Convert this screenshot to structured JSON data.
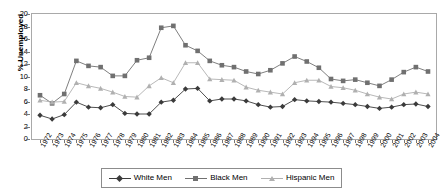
{
  "chart_data": {
    "type": "line",
    "title": "",
    "xlabel": "",
    "ylabel": "% Unemployed",
    "ylim": [
      0,
      20
    ],
    "ytick_step": 2,
    "yticks": [
      0,
      2,
      4,
      6,
      8,
      10,
      12,
      14,
      16,
      18,
      20
    ],
    "grid": false,
    "legend_position": "bottom",
    "x": [
      1972,
      1973,
      1974,
      1975,
      1976,
      1977,
      1978,
      1979,
      1980,
      1981,
      1982,
      1983,
      1984,
      1985,
      1986,
      1987,
      1988,
      1989,
      1990,
      1991,
      1992,
      1993,
      1994,
      1995,
      1996,
      1997,
      1998,
      1999,
      2000,
      2001,
      2002,
      2003,
      2004
    ],
    "categories": [
      "1972",
      "1973",
      "1974",
      "1975",
      "1976",
      "1977",
      "1978",
      "1979",
      "1980",
      "1981",
      "1982",
      "1983",
      "1984",
      "1985",
      "1986",
      "1987",
      "1988",
      "1989",
      "1990",
      "1991",
      "1992",
      "1993",
      "1994",
      "1995",
      "1996",
      "1997",
      "1998",
      "1999",
      "2000",
      "2001",
      "2002",
      "2003",
      "2004"
    ],
    "series": [
      {
        "name": "White Men",
        "color": "#3b3b3b",
        "marker": "diamond",
        "values": [
          3.8,
          3.2,
          3.9,
          5.9,
          5.1,
          5.0,
          5.5,
          4.1,
          4.0,
          4.0,
          5.9,
          6.2,
          8.0,
          8.1,
          6.1,
          6.4,
          6.4,
          6.1,
          5.5,
          5.1,
          5.2,
          6.3,
          6.1,
          6.0,
          5.9,
          5.7,
          5.5,
          5.2,
          4.9,
          5.1,
          5.5,
          5.6,
          5.2
        ]
      },
      {
        "name": "Black Men",
        "color": "#707070",
        "marker": "square",
        "values": [
          7.0,
          5.7,
          7.2,
          12.5,
          11.7,
          11.5,
          10.1,
          10.1,
          12.6,
          13.0,
          17.8,
          18.1,
          15.0,
          14.1,
          12.5,
          11.8,
          11.5,
          10.8,
          10.4,
          11.0,
          12.1,
          13.2,
          12.4,
          11.4,
          9.6,
          9.3,
          9.5,
          9.0,
          8.5,
          9.5,
          10.7,
          11.5,
          10.8
        ]
      },
      {
        "name": "Hispanic Men",
        "color": "#b0b0b0",
        "marker": "triangle",
        "values": [
          6.2,
          5.9,
          6.0,
          9.0,
          8.5,
          8.1,
          7.5,
          6.8,
          6.7,
          8.5,
          9.8,
          9.0,
          12.2,
          12.2,
          9.6,
          9.5,
          9.4,
          8.3,
          7.8,
          7.5,
          7.2,
          9.0,
          9.4,
          9.4,
          8.4,
          8.2,
          7.8,
          7.2,
          6.7,
          6.4,
          7.2,
          7.5,
          7.2
        ]
      }
    ]
  },
  "legend": {
    "items": [
      {
        "label": "White Men"
      },
      {
        "label": "Black Men"
      },
      {
        "label": "Hispanic Men"
      }
    ]
  }
}
